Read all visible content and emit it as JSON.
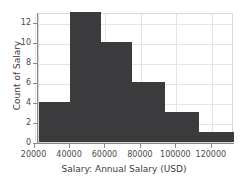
{
  "chart_data": {
    "type": "bar",
    "title": "",
    "subtitle": "",
    "xlabel": "Salary: Annual Salary (USD)",
    "ylabel": "Count of Salary",
    "xlim": [
      22500,
      132500
    ],
    "ylim": [
      0,
      13
    ],
    "grid": true,
    "legend": null,
    "bar_color": "#3b3b3d",
    "grid_color": "#e4e4e4",
    "axis_color": "#8a8a8a",
    "xticks": [
      {
        "value": 20000,
        "label": "20000"
      },
      {
        "value": 40000,
        "label": "40000"
      },
      {
        "value": 60000,
        "label": "60000"
      },
      {
        "value": 80000,
        "label": "80000"
      },
      {
        "value": 100000,
        "label": "100000"
      },
      {
        "value": 120000,
        "label": "120000"
      }
    ],
    "yticks": [
      {
        "value": 0,
        "label": "0"
      },
      {
        "value": 2,
        "label": "2"
      },
      {
        "value": 4,
        "label": "4"
      },
      {
        "value": 6,
        "label": "6"
      },
      {
        "value": 8,
        "label": "8"
      },
      {
        "value": 10,
        "label": "10"
      },
      {
        "value": 12,
        "label": "12"
      }
    ],
    "bins": [
      {
        "bin_start": 22500,
        "bin_end": 40000,
        "count": 4
      },
      {
        "bin_start": 40000,
        "bin_end": 57500,
        "count": 13
      },
      {
        "bin_start": 57500,
        "bin_end": 75000,
        "count": 10
      },
      {
        "bin_start": 75000,
        "bin_end": 93500,
        "count": 6
      },
      {
        "bin_start": 93500,
        "bin_end": 112500,
        "count": 3
      },
      {
        "bin_start": 112500,
        "bin_end": 132500,
        "count": 1
      }
    ],
    "categories": [
      "22500-40000",
      "40000-57500",
      "57500-75000",
      "75000-93500",
      "93500-112500",
      "112500-132500"
    ],
    "values": [
      4,
      13,
      10,
      6,
      3,
      1
    ]
  }
}
